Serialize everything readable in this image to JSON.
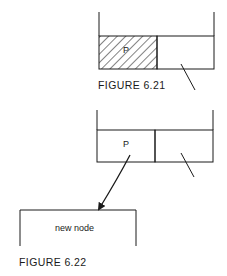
{
  "figures": [
    {
      "caption": "FIGURE 6.21",
      "node": {
        "left_field_label": "P",
        "left_field_shaded": true,
        "right_field": "null-pointer"
      }
    },
    {
      "caption": "FIGURE 6.22",
      "node": {
        "left_field_label": "P",
        "left_field_shaded": false,
        "right_field": "null-pointer"
      },
      "target_node_label": "new node"
    }
  ],
  "colors": {
    "line": "#1a1a1a",
    "background": "#ffffff"
  }
}
